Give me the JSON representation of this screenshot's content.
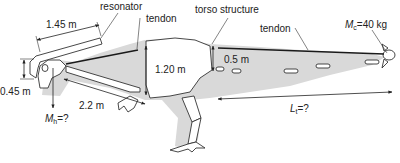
{
  "diagram": {
    "labels": {
      "resonator": "resonator",
      "tendon_front": "tendon",
      "torso_structure": "torso structure",
      "tendon_tail": "tendon",
      "tail_mass_symbol": "M",
      "tail_mass_sub": "c",
      "tail_mass_value": "=40 kg",
      "head_mass_symbol": "M",
      "head_mass_sub": "h",
      "head_mass_value": "=?",
      "tail_length_symbol": "L",
      "tail_length_sub": "t",
      "tail_length_value": "=?"
    },
    "dimensions": {
      "resonator_length": "1.45 m",
      "head_height": "0.45 m",
      "neck_length": "2.2 m",
      "torso_height": "1.20 m",
      "tail_base_height": "0.5 m"
    },
    "colors": {
      "body_shade": "#d9d9d9",
      "outline": "#333333",
      "tendon": "#1a1a1a",
      "background": "#ffffff"
    }
  }
}
